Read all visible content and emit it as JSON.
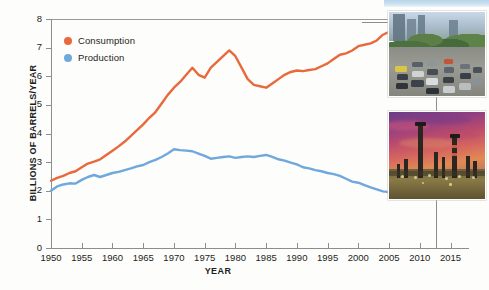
{
  "chart_data": {
    "type": "line",
    "title": "",
    "xlabel": "YEAR",
    "ylabel": "BILLIONS OF BARRELS/YEAR",
    "xlim": [
      1950,
      2018
    ],
    "ylim": [
      0,
      8
    ],
    "xticks": [
      1950,
      1955,
      1960,
      1965,
      1970,
      1975,
      1980,
      1985,
      1990,
      1995,
      2000,
      2005,
      2010,
      2015
    ],
    "yticks": [
      0,
      1,
      2,
      3,
      4,
      5,
      6,
      7,
      8
    ],
    "grid": false,
    "legend_position": "top-left",
    "series": [
      {
        "name": "Consumption",
        "color": "#E8693C",
        "x": [
          1950,
          1951,
          1952,
          1953,
          1954,
          1955,
          1956,
          1957,
          1958,
          1959,
          1960,
          1961,
          1962,
          1963,
          1964,
          1965,
          1966,
          1967,
          1968,
          1969,
          1970,
          1971,
          1972,
          1973,
          1974,
          1975,
          1976,
          1977,
          1978,
          1979,
          1980,
          1981,
          1982,
          1983,
          1984,
          1985,
          1986,
          1987,
          1988,
          1989,
          1990,
          1991,
          1992,
          1993,
          1994,
          1995,
          1996,
          1997,
          1998,
          1999,
          2000,
          2001,
          2002,
          2003,
          2004,
          2005,
          2006,
          2007,
          2008,
          2009,
          2010,
          2011,
          2012,
          2013,
          2014,
          2015,
          2016,
          2017
        ],
        "values": [
          2.35,
          2.45,
          2.52,
          2.62,
          2.68,
          2.82,
          2.95,
          3.02,
          3.1,
          3.25,
          3.4,
          3.55,
          3.72,
          3.92,
          4.12,
          4.32,
          4.55,
          4.75,
          5.05,
          5.35,
          5.6,
          5.8,
          6.05,
          6.3,
          6.05,
          5.95,
          6.3,
          6.5,
          6.7,
          6.9,
          6.7,
          6.3,
          5.9,
          5.7,
          5.65,
          5.6,
          5.75,
          5.9,
          6.05,
          6.15,
          6.2,
          6.18,
          6.22,
          6.25,
          6.35,
          6.45,
          6.6,
          6.75,
          6.8,
          6.9,
          7.05,
          7.1,
          7.15,
          7.25,
          7.45,
          7.55,
          7.6,
          7.62,
          7.5,
          7.25,
          7.32,
          7.18,
          7.25,
          7.28,
          7.25,
          7.38,
          7.4,
          7.42
        ]
      },
      {
        "name": "Production",
        "color": "#6FA8DC",
        "x": [
          1950,
          1951,
          1952,
          1953,
          1954,
          1955,
          1956,
          1957,
          1958,
          1959,
          1960,
          1961,
          1962,
          1963,
          1964,
          1965,
          1966,
          1967,
          1968,
          1969,
          1970,
          1971,
          1972,
          1973,
          1974,
          1975,
          1976,
          1977,
          1978,
          1979,
          1980,
          1981,
          1982,
          1983,
          1984,
          1985,
          1986,
          1987,
          1988,
          1989,
          1990,
          1991,
          1992,
          1993,
          1994,
          1995,
          1996,
          1997,
          1998,
          1999,
          2000,
          2001,
          2002,
          2003,
          2004,
          2005,
          2006,
          2007,
          2008,
          2009,
          2010,
          2011,
          2012,
          2013,
          2014,
          2015,
          2016,
          2017
        ],
        "values": [
          2.0,
          2.15,
          2.22,
          2.26,
          2.25,
          2.38,
          2.48,
          2.55,
          2.48,
          2.55,
          2.62,
          2.66,
          2.72,
          2.78,
          2.85,
          2.9,
          3.0,
          3.08,
          3.18,
          3.3,
          3.45,
          3.42,
          3.4,
          3.38,
          3.3,
          3.22,
          3.12,
          3.15,
          3.18,
          3.2,
          3.15,
          3.18,
          3.2,
          3.18,
          3.22,
          3.25,
          3.18,
          3.1,
          3.05,
          2.98,
          2.92,
          2.82,
          2.78,
          2.72,
          2.68,
          2.62,
          2.58,
          2.52,
          2.42,
          2.32,
          2.28,
          2.2,
          2.12,
          2.05,
          1.98,
          1.95,
          1.93,
          1.92,
          1.9,
          1.92,
          2.0,
          2.18,
          2.45,
          2.72,
          3.02,
          3.28,
          3.42,
          3.48
        ]
      }
    ],
    "annotations": [
      {
        "label": "traffic-photo",
        "caption": "",
        "series_ref": "Consumption"
      },
      {
        "label": "refinery-photo",
        "caption": "",
        "series_ref": "Production"
      }
    ]
  },
  "legend": {
    "items": [
      {
        "label": "Consumption",
        "color": "#E8693C"
      },
      {
        "label": "Production",
        "color": "#6FA8DC"
      }
    ]
  },
  "axes": {
    "y_title": "BILLIONS OF BARRELS/YEAR",
    "x_title": "YEAR",
    "y_tick_labels": [
      "8",
      "7",
      "6",
      "5",
      "4",
      "3",
      "2",
      "1",
      "0"
    ],
    "x_tick_labels": [
      "1950",
      "1955",
      "1960",
      "1965",
      "1970",
      "1975",
      "1980",
      "1985",
      "1990",
      "1995",
      "2000",
      "2005",
      "2010",
      "2015"
    ]
  },
  "insets": {
    "top": {
      "name": "traffic-photo",
      "alt": "Heavy car traffic on a tree-lined city street"
    },
    "bottom": {
      "name": "refinery-photo",
      "alt": "Oil refinery towers silhouetted against a purple and orange sunset"
    }
  },
  "colors": {
    "consumption": "#E8693C",
    "production": "#6FA8DC",
    "axis": "#8D8D8D",
    "text": "#1D1D1B"
  }
}
